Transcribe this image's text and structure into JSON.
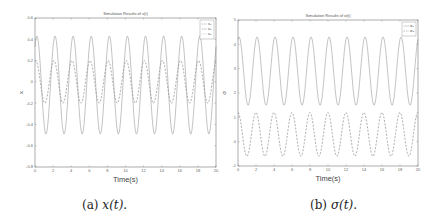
{
  "figure": {
    "panels": [
      {
        "caption_prefix": "(a)",
        "caption_math": "x(t)",
        "caption_suffix": "."
      },
      {
        "caption_prefix": "(b)",
        "caption_math": "σ(t)",
        "caption_suffix": "."
      }
    ]
  },
  "chart_data": [
    {
      "type": "line",
      "title": "Simulation Results of x(t)",
      "xlabel": "Time(s)",
      "ylabel": "x",
      "xlim": [
        0,
        20
      ],
      "ylim": [
        -0.8,
        0.6
      ],
      "xticks": [
        0,
        2,
        4,
        6,
        8,
        10,
        12,
        14,
        16,
        18,
        20
      ],
      "yticks": [
        -0.8,
        -0.6,
        -0.4,
        -0.2,
        0,
        0.2,
        0.4,
        0.6
      ],
      "ytick_labels": [
        "-0.8",
        "-0.6",
        "-0.4",
        "-0.2",
        "0",
        "0.2",
        "0.4",
        "0.6"
      ],
      "legend_position": "upper right",
      "grid": false,
      "values_are_estimates": true,
      "series": [
        {
          "name": "x1",
          "legend_label": "x₁",
          "style": "dashed",
          "color": "#777777",
          "offset": 0.0,
          "amplitude": 0.2,
          "period": 2.0,
          "phase": 1.3
        },
        {
          "name": "x2",
          "legend_label": "x₂",
          "style": "solid",
          "color": "#9a9a9a",
          "offset": -0.03,
          "amplitude": 0.46,
          "period": 2.0,
          "phase": 0.9
        },
        {
          "name": "x3",
          "legend_label": "x₃",
          "style": "dotted",
          "color": "#888888",
          "offset": 0.0,
          "amplitude": 0.0,
          "period": 2.0,
          "phase": 0.0
        }
      ]
    },
    {
      "type": "line",
      "title": "Simulation Results of σ(t)",
      "xlabel": "Time(s)",
      "ylabel": "σ",
      "xlim": [
        0,
        20
      ],
      "ylim": [
        -1,
        5
      ],
      "xticks": [
        0,
        2,
        4,
        6,
        8,
        10,
        12,
        14,
        16,
        18,
        20
      ],
      "yticks": [
        -1,
        0,
        1,
        2,
        3,
        4,
        5
      ],
      "ytick_labels": [
        "-1",
        "0",
        "1",
        "2",
        "3",
        "4",
        "5"
      ],
      "legend_position": "upper right",
      "grid": false,
      "values_are_estimates": true,
      "series": [
        {
          "name": "sigma1",
          "legend_label": "σ₁",
          "style": "solid",
          "color": "#9a9a9a",
          "offset": 2.9,
          "amplitude": 1.4,
          "period": 2.0,
          "phase": 1.2
        },
        {
          "name": "sigma2",
          "legend_label": "σ₂",
          "style": "dashed",
          "color": "#777777",
          "offset": 0.3,
          "amplitude": 0.9,
          "period": 2.0,
          "phase": 1.6
        }
      ]
    }
  ]
}
